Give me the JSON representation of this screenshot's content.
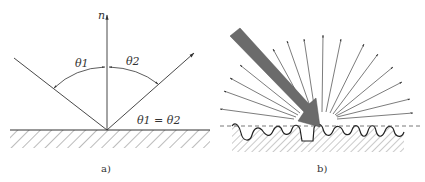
{
  "panel_a": {
    "normal_label": "n",
    "theta1_label": "θ1",
    "theta2_label": "θ2",
    "equation_label": "θ1 = θ2",
    "caption": "a)"
  },
  "panel_b": {
    "caption": "b)"
  },
  "colors": {
    "line": "#333333",
    "beam": "#6b6b6b",
    "hatch": "#555555"
  }
}
